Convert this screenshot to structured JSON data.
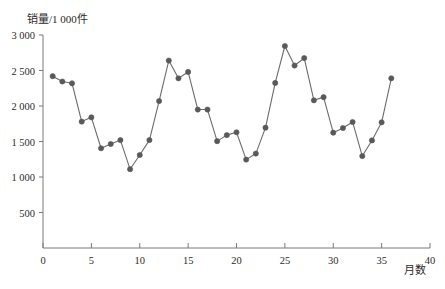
{
  "chart_data": {
    "type": "line",
    "title": "",
    "subtitle": "",
    "xlabel": "月数",
    "ylabel": "销量/1 000件",
    "x": [
      1,
      2,
      3,
      4,
      5,
      6,
      7,
      8,
      9,
      10,
      11,
      12,
      13,
      14,
      15,
      16,
      17,
      18,
      19,
      20,
      21,
      22,
      23,
      24,
      25,
      26,
      27,
      28,
      29,
      30,
      31,
      32,
      33,
      34,
      35,
      36
    ],
    "values": [
      2420,
      2345,
      2320,
      1780,
      1840,
      1405,
      1465,
      1520,
      1110,
      1310,
      1520,
      2070,
      2640,
      2390,
      2480,
      1950,
      1950,
      1505,
      1590,
      1630,
      1245,
      1330,
      1695,
      2325,
      2845,
      2570,
      2675,
      2080,
      2125,
      1625,
      1690,
      1775,
      1295,
      1515,
      1770,
      2390
    ],
    "series": [
      {
        "name": "销量",
        "values": [
          2420,
          2345,
          2320,
          1780,
          1840,
          1405,
          1465,
          1520,
          1110,
          1310,
          1520,
          2070,
          2640,
          2390,
          2480,
          1950,
          1950,
          1505,
          1590,
          1630,
          1245,
          1330,
          1695,
          2325,
          2845,
          2570,
          2675,
          2080,
          2125,
          1625,
          1690,
          1775,
          1295,
          1515,
          1770,
          2390
        ]
      }
    ],
    "xlim": [
      0,
      40
    ],
    "ylim": [
      0,
      3000
    ],
    "xticks": [
      0,
      5,
      10,
      15,
      20,
      25,
      30,
      35,
      40
    ],
    "xtick_labels": [
      "0",
      "5",
      "10",
      "15",
      "20",
      "25",
      "30",
      "35",
      "40"
    ],
    "yticks": [
      0,
      500,
      1000,
      1500,
      2000,
      2500,
      3000
    ],
    "ytick_labels": [
      "0",
      "500",
      "1 000",
      "1 500",
      "2 000",
      "2 500",
      "3 000"
    ],
    "grid": false,
    "legend": false,
    "legend_position": "none",
    "marker": "circle",
    "line_color": "#6b6b6b",
    "marker_color": "#595959",
    "axis_color": "#7a7a7a",
    "background_color": "#ffffff"
  }
}
